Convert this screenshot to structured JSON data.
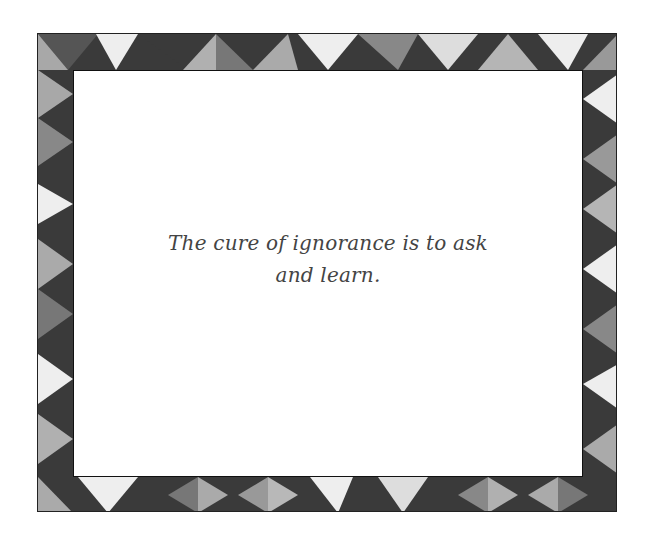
{
  "card": {
    "quote_line1": "The cure of ignorance is to ask",
    "quote_line2": "and learn.",
    "border_pattern": "geometric-triangles-grayscale",
    "colors": {
      "dark": "#3a3a3a",
      "mid": "#7a7a7a",
      "light": "#b0b0b0",
      "white_bar": "#eeeeee",
      "frame_line": "#222222"
    }
  }
}
